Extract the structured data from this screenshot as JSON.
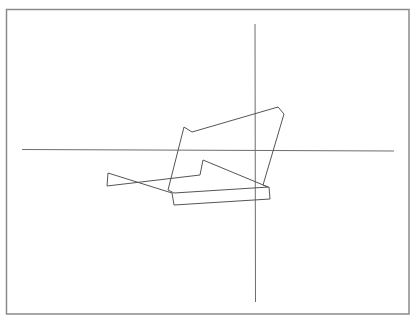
{
  "chart_data": {
    "type": "line",
    "title": "",
    "xlabel": "",
    "ylabel": "",
    "grid": false,
    "legend": null,
    "frame": {
      "x1": 6.5,
      "y1": 9.5,
      "x2": 409,
      "y2": 314,
      "color": "#8a8a8a",
      "width": 1.5
    },
    "axes": {
      "color": "#6e6e6e",
      "width": 1,
      "horizontal": {
        "x1": 22,
        "y1": 149.5,
        "x2": 394,
        "y2": 151
      },
      "vertical": {
        "x1": 255,
        "y1": 24,
        "x2": 255.5,
        "y2": 302
      }
    },
    "series": [
      {
        "name": "path",
        "color": "#555555",
        "width": 1,
        "points": [
          [
            107,
            186
          ],
          [
            108,
            173
          ],
          [
            172,
            193
          ],
          [
            174,
            205
          ],
          [
            270,
            199
          ],
          [
            269,
            187
          ],
          [
            174,
            193
          ],
          [
            168,
            190
          ],
          [
            184,
            127
          ],
          [
            192,
            132
          ],
          [
            278,
            107
          ],
          [
            284,
            114
          ],
          [
            263,
            185
          ],
          [
            268,
            187
          ],
          [
            203,
            160
          ],
          [
            200,
            175
          ],
          [
            107,
            186
          ]
        ]
      }
    ]
  }
}
